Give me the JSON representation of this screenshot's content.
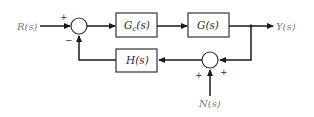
{
  "diagram": {
    "type": "feedback-control-block-diagram",
    "input": {
      "label": "R(s)"
    },
    "output": {
      "label": "Y(s)"
    },
    "disturbance": {
      "label": "N(s)"
    },
    "blocks": [
      {
        "id": "controller",
        "label_main": "G",
        "label_sub": "c",
        "label_tail": "(s)"
      },
      {
        "id": "plant",
        "label": "G(s)"
      },
      {
        "id": "feedback",
        "label": "H(s)"
      }
    ],
    "summing_junctions": [
      {
        "id": "sum1",
        "signs": {
          "input": "+",
          "feedback": "−"
        }
      },
      {
        "id": "sum2",
        "signs": {
          "output_feedback": "+",
          "noise": "+"
        }
      }
    ],
    "colors": {
      "line": "#1a1a1a",
      "block_border": "#333333",
      "label": "#7a7a7a",
      "background": "#ffffff"
    }
  }
}
